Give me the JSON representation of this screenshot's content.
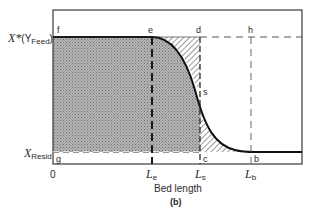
{
  "figure": {
    "caption": "(b)",
    "xlabel": "Bed length",
    "ylabels": {
      "top": {
        "main": "X*",
        "paren": "(Y",
        "sub": "Feed",
        "close": ")"
      },
      "bottom": {
        "main": "X",
        "sub": "Resid"
      }
    },
    "xticks": {
      "origin": "0",
      "le": {
        "main": "L",
        "sub": "e"
      },
      "ls": {
        "main": "L",
        "sub": "s"
      },
      "lb": {
        "main": "L",
        "sub": "b"
      }
    },
    "points": {
      "f": "f",
      "e": "e",
      "d": "d",
      "h": "h",
      "s": "s",
      "g": "g",
      "c": "c",
      "b": "b"
    },
    "regions": {
      "saturated": "stippled region (used bed equivalent)",
      "mtz_unused": "hatched region above curve between e and d",
      "mtz_used": "hatched region below curve between c and b"
    },
    "colors": {
      "stipple": "#9a9a9a",
      "line": "#1a1a1a",
      "frame": "#3a3a3a"
    }
  }
}
